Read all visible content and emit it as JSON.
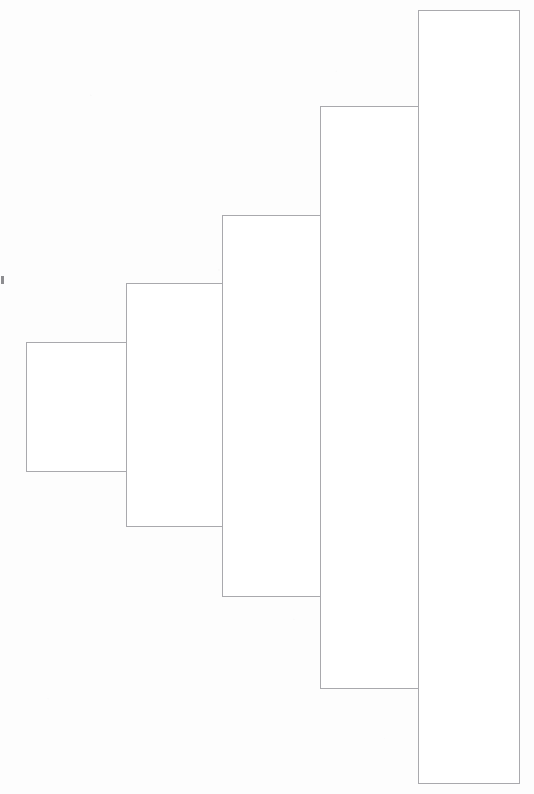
{
  "page": {
    "width": 534,
    "height": 794,
    "background_color": "#fdfdfd",
    "stroke_color": "#a9a9ad",
    "fill_color": "#ffffff",
    "stroke_width": 1,
    "orientation": "vertical-bars-ascending-left-to-right",
    "notes_label": "unlabeled bar chart, no axes, no text"
  },
  "marks": {
    "left_edge_tick": {
      "name": "left-edge-tick-mark",
      "x": 0,
      "y": 275,
      "width": 3,
      "height": 8,
      "color": "#8d8d90"
    }
  },
  "chart_data": {
    "type": "bar",
    "title": "",
    "subtitle": "",
    "xlabel": "",
    "ylabel": "",
    "grid": false,
    "legend": false,
    "legend_position": "none",
    "axis_visible": false,
    "tick_labels_x": [
      "",
      "",
      "",
      "",
      ""
    ],
    "tick_labels_y": [],
    "categories": [
      "1",
      "2",
      "3",
      "4",
      "5"
    ],
    "values": [
      129,
      243,
      381,
      582,
      773
    ],
    "value_units": "pixels (bar height as drawn)",
    "ylim": [
      0,
      794
    ],
    "xlim": [
      0,
      534
    ],
    "annotations": [],
    "bars": [
      {
        "name": "bar-1",
        "category": "1",
        "x": 26,
        "y": 342,
        "width": 101,
        "height": 129,
        "top": 342,
        "bottom": 471,
        "left": 26,
        "right": 127,
        "fill": "#ffffff",
        "stroke": "#a9a9ad"
      },
      {
        "name": "bar-2",
        "category": "2",
        "x": 126,
        "y": 283,
        "width": 96,
        "height": 243,
        "top": 283,
        "bottom": 526,
        "left": 126,
        "right": 222,
        "fill": "#ffffff",
        "stroke": "#a9a9ad"
      },
      {
        "name": "bar-3",
        "category": "3",
        "x": 222,
        "y": 215,
        "width": 99,
        "height": 381,
        "top": 215,
        "bottom": 596,
        "left": 222,
        "right": 321,
        "fill": "#ffffff",
        "stroke": "#a9a9ad"
      },
      {
        "name": "bar-4",
        "category": "4",
        "x": 320,
        "y": 106,
        "width": 99,
        "height": 582,
        "top": 106,
        "bottom": 688,
        "left": 320,
        "right": 419,
        "fill": "#ffffff",
        "stroke": "#a9a9ad"
      },
      {
        "name": "bar-5",
        "category": "5",
        "x": 418,
        "y": 10,
        "width": 101,
        "height": 773,
        "top": 10,
        "bottom": 783,
        "left": 418,
        "right": 519,
        "fill": "#ffffff",
        "stroke": "#a9a9ad"
      }
    ]
  }
}
